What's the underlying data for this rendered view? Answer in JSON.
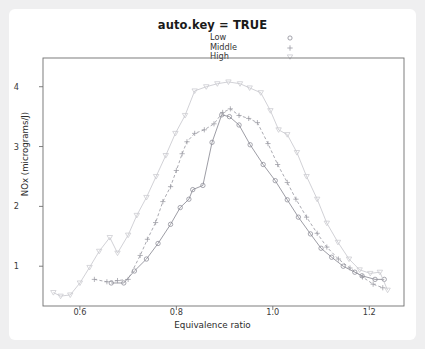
{
  "title": "auto.key = TRUE",
  "legend": {
    "position": "top-center",
    "items": [
      {
        "label": "Low",
        "symbol": "open-circle",
        "symbol_name": "circle-icon"
      },
      {
        "label": "Middle",
        "symbol": "plus",
        "symbol_name": "plus-icon"
      },
      {
        "label": "High",
        "symbol": "inverted-triangle",
        "symbol_name": "triangle-down-icon"
      }
    ]
  },
  "axes": {
    "x": {
      "label": "Equivalence ratio",
      "ticks": [
        "0.6",
        "0.8",
        "1.0",
        "1.2"
      ],
      "tick_values": [
        0.6,
        0.8,
        1.0,
        1.2
      ],
      "min": 0.53,
      "min_view": 0.5235,
      "max_view": 1.272
    },
    "y": {
      "label": "NOx (micrograms/J)",
      "ticks": [
        "1",
        "2",
        "3",
        "4"
      ],
      "tick_values": [
        1,
        2,
        3,
        4
      ],
      "min_view": 0.335,
      "max_view": 4.48
    }
  },
  "colors": {
    "low": "#8b8b95",
    "middle": "#9b9ba3",
    "high": "#c9c9cf",
    "frame": "#6f6f6f",
    "panel": "#ffffff",
    "page": "#efeff0",
    "text": "#2b2b2b"
  },
  "chart_data": {
    "type": "scatter",
    "title": "auto.key = TRUE",
    "xlabel": "Equivalence ratio",
    "ylabel": "NOx (micrograms/J)",
    "xlim": [
      0.5235,
      1.272
    ],
    "ylim": [
      0.335,
      4.48
    ],
    "grid": false,
    "legend_position": "top-center",
    "series": [
      {
        "name": "Low",
        "symbol": "open-circle",
        "color": "#8b8b95",
        "line": "solid",
        "points": [
          [
            0.665,
            0.72
          ],
          [
            0.691,
            0.72
          ],
          [
            0.713,
            0.92
          ],
          [
            0.738,
            1.12
          ],
          [
            0.762,
            1.38
          ],
          [
            0.788,
            1.7
          ],
          [
            0.808,
            1.98
          ],
          [
            0.826,
            2.12
          ],
          [
            0.834,
            2.28
          ],
          [
            0.855,
            2.35
          ],
          [
            0.874,
            3.07
          ],
          [
            0.894,
            3.53
          ],
          [
            0.91,
            3.5
          ],
          [
            0.93,
            3.36
          ],
          [
            0.953,
            3.03
          ],
          [
            0.98,
            2.7
          ],
          [
            1.005,
            2.43
          ],
          [
            1.03,
            2.11
          ],
          [
            1.053,
            1.82
          ],
          [
            1.078,
            1.54
          ],
          [
            1.1,
            1.3
          ],
          [
            1.122,
            1.15
          ],
          [
            1.146,
            1.0
          ],
          [
            1.17,
            0.9
          ],
          [
            1.185,
            0.84
          ],
          [
            1.212,
            0.78
          ],
          [
            1.231,
            0.78
          ]
        ]
      },
      {
        "name": "Middle",
        "symbol": "plus",
        "color": "#9b9ba3",
        "line": "dashed",
        "points": [
          [
            0.63,
            0.78
          ],
          [
            0.656,
            0.74
          ],
          [
            0.678,
            0.76
          ],
          [
            0.7,
            0.78
          ],
          [
            0.725,
            1.18
          ],
          [
            0.74,
            1.45
          ],
          [
            0.757,
            1.73
          ],
          [
            0.772,
            2.08
          ],
          [
            0.788,
            2.33
          ],
          [
            0.8,
            2.6
          ],
          [
            0.812,
            2.88
          ],
          [
            0.822,
            3.08
          ],
          [
            0.838,
            3.22
          ],
          [
            0.858,
            3.28
          ],
          [
            0.878,
            3.38
          ],
          [
            0.896,
            3.57
          ],
          [
            0.912,
            3.63
          ],
          [
            0.93,
            3.52
          ],
          [
            0.95,
            3.47
          ],
          [
            0.968,
            3.4
          ],
          [
            0.99,
            3.05
          ],
          [
            1.01,
            2.7
          ],
          [
            1.03,
            2.4
          ],
          [
            1.048,
            2.12
          ],
          [
            1.07,
            1.82
          ],
          [
            1.092,
            1.55
          ],
          [
            1.112,
            1.32
          ],
          [
            1.136,
            1.12
          ],
          [
            1.16,
            0.97
          ],
          [
            1.186,
            0.82
          ],
          [
            1.208,
            0.7
          ],
          [
            1.228,
            0.64
          ]
        ]
      },
      {
        "name": "High",
        "symbol": "inverted-triangle",
        "color": "#c9c9cf",
        "line": "solid",
        "points": [
          [
            0.545,
            0.56
          ],
          [
            0.56,
            0.5
          ],
          [
            0.58,
            0.52
          ],
          [
            0.6,
            0.72
          ],
          [
            0.62,
            0.98
          ],
          [
            0.64,
            1.25
          ],
          [
            0.662,
            1.48
          ],
          [
            0.678,
            1.22
          ],
          [
            0.7,
            1.52
          ],
          [
            0.718,
            1.85
          ],
          [
            0.738,
            2.15
          ],
          [
            0.758,
            2.5
          ],
          [
            0.778,
            2.85
          ],
          [
            0.798,
            3.22
          ],
          [
            0.818,
            3.52
          ],
          [
            0.838,
            3.93
          ],
          [
            0.862,
            4.0
          ],
          [
            0.885,
            4.05
          ],
          [
            0.908,
            4.08
          ],
          [
            0.932,
            4.05
          ],
          [
            0.952,
            3.98
          ],
          [
            0.975,
            3.9
          ],
          [
            0.995,
            3.6
          ],
          [
            1.012,
            3.28
          ],
          [
            1.03,
            3.2
          ],
          [
            1.05,
            2.9
          ],
          [
            1.07,
            2.5
          ],
          [
            1.092,
            2.12
          ],
          [
            1.112,
            1.72
          ],
          [
            1.135,
            1.4
          ],
          [
            1.158,
            1.12
          ],
          [
            1.18,
            0.94
          ],
          [
            1.202,
            0.88
          ],
          [
            1.222,
            0.9
          ],
          [
            1.238,
            0.6
          ]
        ]
      }
    ]
  }
}
